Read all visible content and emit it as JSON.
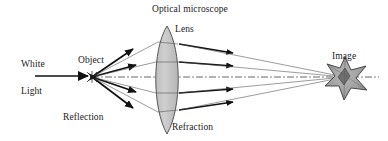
{
  "diagram": {
    "title": "Optical microscope",
    "background_color": "#ffffff",
    "ink_color": "#1b1b1b",
    "lens_fill_color": "#c8c8c8",
    "star_fill_color": "#9a9a9a",
    "labels": {
      "title": "Optical microscope",
      "lens": "Lens",
      "object": "Object",
      "white": "White",
      "light": "Light",
      "reflection": "Reflection",
      "refraction": "Refraction",
      "image": "Image"
    },
    "components": [
      {
        "name": "white-light-arrow",
        "label": "White Light",
        "kind": "incident-beam"
      },
      {
        "name": "object-point",
        "label": "Object",
        "kind": "source-point"
      },
      {
        "name": "lens",
        "label": "Lens",
        "kind": "biconvex-lens"
      },
      {
        "name": "image-star",
        "label": "Image",
        "kind": "formed-image"
      },
      {
        "name": "optical-axis",
        "label": "",
        "kind": "dash-dot-axis"
      },
      {
        "name": "reflection-rays",
        "label": "Reflection",
        "kind": "ray-bundle"
      },
      {
        "name": "refraction-rays",
        "label": "Refraction",
        "kind": "ray-bundle"
      }
    ],
    "geometry": {
      "object_point": [
        92,
        77
      ],
      "image_point": [
        345,
        77
      ],
      "lens_center": [
        167,
        79
      ],
      "lens_half_width": 12,
      "lens_top": 26,
      "lens_bottom": 134,
      "axis_start_x": 92,
      "axis_end_x": 379,
      "incident_arrow_start_x": 35,
      "incident_arrow_end_x": 91,
      "ray_lens_y": [
        42,
        62,
        93,
        112
      ],
      "ray_count": 4
    }
  }
}
